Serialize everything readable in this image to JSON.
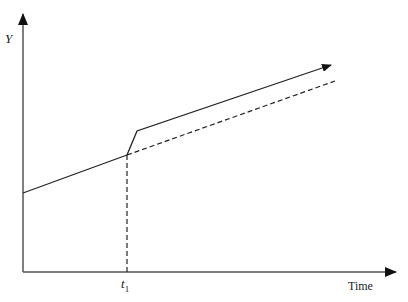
{
  "diagram": {
    "y_axis_label": "Y",
    "x_axis_label": "Time",
    "marker_label_base": "t",
    "marker_label_sub": "1",
    "colors": {
      "line": "#222222",
      "axis": "#555555",
      "background": "#ffffff"
    },
    "elements": [
      {
        "name": "baseline-trend",
        "style": "solid",
        "description": "Y rising linearly from left axis to t1"
      },
      {
        "name": "jump-segment",
        "style": "solid",
        "description": "Step-up shortly after t1"
      },
      {
        "name": "new-trend",
        "style": "solid-arrow",
        "description": "Higher trend continuing after t1"
      },
      {
        "name": "counterfactual-trend",
        "style": "dashed",
        "description": "Baseline trend extended past t1"
      },
      {
        "name": "t1-marker",
        "style": "dashed",
        "description": "Vertical dashed line at t1"
      }
    ]
  }
}
